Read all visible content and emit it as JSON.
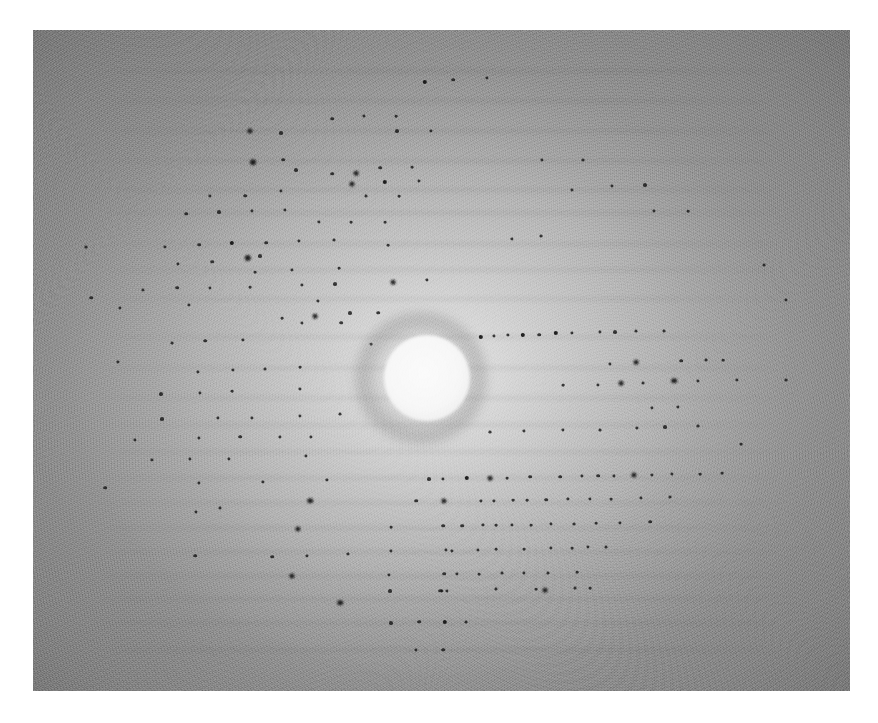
{
  "image": {
    "kind": "photograph",
    "subject": "x-ray-diffraction-pattern",
    "caption": "",
    "border_color": "#ffffff",
    "print": {
      "left": 33,
      "top": 30,
      "width": 817,
      "height": 661,
      "base_color": "#9a9a9a",
      "center_color": "#c9c9c9",
      "corner_color": "#7d7d7d",
      "grain": "heavy film grain / halftone screen"
    },
    "beam_stop": {
      "label": "beam-stop shadow",
      "center_x": 427,
      "center_y": 378,
      "radius": 43,
      "color": "#fafafa",
      "halo_color": "#6f6f6f"
    }
  },
  "chart_data": {
    "type": "scatter",
    "title": "",
    "subtitle": "",
    "xlabel": "",
    "ylabel": "",
    "grid": false,
    "legend": "none",
    "xlim": [
      33,
      850
    ],
    "ylim": [
      30,
      691
    ],
    "spot_color": "#161616",
    "layer_lines_y": [
      71,
      101,
      131,
      161,
      190,
      213,
      244,
      270,
      299,
      337,
      368,
      398,
      425,
      452,
      478,
      503,
      528,
      552,
      576,
      599,
      623,
      650
    ],
    "points": [
      {
        "x": 250,
        "y": 131,
        "r": 2.6
      },
      {
        "x": 281,
        "y": 133,
        "r": 2.0
      },
      {
        "x": 332,
        "y": 119,
        "r": 1.8
      },
      {
        "x": 364,
        "y": 116,
        "r": 1.6
      },
      {
        "x": 396,
        "y": 116,
        "r": 1.4
      },
      {
        "x": 425,
        "y": 82,
        "r": 2.2
      },
      {
        "x": 453,
        "y": 80,
        "r": 1.8
      },
      {
        "x": 487,
        "y": 78,
        "r": 1.6
      },
      {
        "x": 397,
        "y": 131,
        "r": 2.0
      },
      {
        "x": 431,
        "y": 131,
        "r": 1.6
      },
      {
        "x": 253,
        "y": 162,
        "r": 3.0
      },
      {
        "x": 283,
        "y": 160,
        "r": 1.8
      },
      {
        "x": 296,
        "y": 170,
        "r": 2.0
      },
      {
        "x": 380,
        "y": 168,
        "r": 1.8
      },
      {
        "x": 412,
        "y": 167,
        "r": 1.4
      },
      {
        "x": 356,
        "y": 173,
        "r": 2.4
      },
      {
        "x": 332,
        "y": 174,
        "r": 1.8
      },
      {
        "x": 542,
        "y": 160,
        "r": 1.6
      },
      {
        "x": 583,
        "y": 160,
        "r": 1.5
      },
      {
        "x": 210,
        "y": 196,
        "r": 1.6
      },
      {
        "x": 245,
        "y": 196,
        "r": 1.8
      },
      {
        "x": 281,
        "y": 191,
        "r": 1.6
      },
      {
        "x": 352,
        "y": 184,
        "r": 2.6
      },
      {
        "x": 385,
        "y": 182,
        "r": 2.2
      },
      {
        "x": 419,
        "y": 181,
        "r": 1.6
      },
      {
        "x": 366,
        "y": 196,
        "r": 1.5
      },
      {
        "x": 399,
        "y": 196,
        "r": 1.4
      },
      {
        "x": 612,
        "y": 186,
        "r": 1.6
      },
      {
        "x": 645,
        "y": 185,
        "r": 2.0
      },
      {
        "x": 572,
        "y": 190,
        "r": 1.6
      },
      {
        "x": 186,
        "y": 214,
        "r": 1.8
      },
      {
        "x": 219,
        "y": 212,
        "r": 2.0
      },
      {
        "x": 252,
        "y": 211,
        "r": 1.6
      },
      {
        "x": 285,
        "y": 210,
        "r": 1.6
      },
      {
        "x": 319,
        "y": 222,
        "r": 1.6
      },
      {
        "x": 351,
        "y": 222,
        "r": 1.4
      },
      {
        "x": 385,
        "y": 222,
        "r": 1.4
      },
      {
        "x": 654,
        "y": 211,
        "r": 1.6
      },
      {
        "x": 688,
        "y": 211,
        "r": 1.4
      },
      {
        "x": 165,
        "y": 247,
        "r": 1.6
      },
      {
        "x": 199,
        "y": 245,
        "r": 1.8
      },
      {
        "x": 232,
        "y": 243,
        "r": 2.2
      },
      {
        "x": 266,
        "y": 243,
        "r": 1.8
      },
      {
        "x": 299,
        "y": 241,
        "r": 1.6
      },
      {
        "x": 334,
        "y": 240,
        "r": 1.5
      },
      {
        "x": 248,
        "y": 258,
        "r": 3.2
      },
      {
        "x": 212,
        "y": 262,
        "r": 1.8
      },
      {
        "x": 178,
        "y": 264,
        "r": 1.6
      },
      {
        "x": 388,
        "y": 245,
        "r": 1.4
      },
      {
        "x": 512,
        "y": 239,
        "r": 1.6
      },
      {
        "x": 541,
        "y": 236,
        "r": 1.5
      },
      {
        "x": 260,
        "y": 256,
        "r": 2.0
      },
      {
        "x": 292,
        "y": 270,
        "r": 1.6
      },
      {
        "x": 255,
        "y": 272,
        "r": 1.4
      },
      {
        "x": 339,
        "y": 268,
        "r": 1.4
      },
      {
        "x": 143,
        "y": 290,
        "r": 1.6
      },
      {
        "x": 177,
        "y": 288,
        "r": 1.8
      },
      {
        "x": 210,
        "y": 288,
        "r": 1.6
      },
      {
        "x": 250,
        "y": 287,
        "r": 1.4
      },
      {
        "x": 302,
        "y": 285,
        "r": 1.6
      },
      {
        "x": 335,
        "y": 284,
        "r": 2.0
      },
      {
        "x": 393,
        "y": 282,
        "r": 2.4
      },
      {
        "x": 427,
        "y": 280,
        "r": 1.6
      },
      {
        "x": 120,
        "y": 308,
        "r": 1.6
      },
      {
        "x": 189,
        "y": 305,
        "r": 1.6
      },
      {
        "x": 318,
        "y": 301,
        "r": 1.6
      },
      {
        "x": 350,
        "y": 313,
        "r": 2.0
      },
      {
        "x": 315,
        "y": 316,
        "r": 2.4
      },
      {
        "x": 378,
        "y": 313,
        "r": 1.8
      },
      {
        "x": 341,
        "y": 323,
        "r": 1.8
      },
      {
        "x": 302,
        "y": 323,
        "r": 1.6
      },
      {
        "x": 282,
        "y": 318,
        "r": 1.4
      },
      {
        "x": 481,
        "y": 337,
        "r": 2.2
      },
      {
        "x": 494,
        "y": 336,
        "r": 1.6
      },
      {
        "x": 508,
        "y": 335,
        "r": 1.6
      },
      {
        "x": 523,
        "y": 335,
        "r": 2.2
      },
      {
        "x": 539,
        "y": 335,
        "r": 1.8
      },
      {
        "x": 556,
        "y": 333,
        "r": 2.2
      },
      {
        "x": 572,
        "y": 333,
        "r": 1.6
      },
      {
        "x": 600,
        "y": 332,
        "r": 1.6
      },
      {
        "x": 615,
        "y": 332,
        "r": 2.0
      },
      {
        "x": 636,
        "y": 331,
        "r": 1.5
      },
      {
        "x": 664,
        "y": 331,
        "r": 1.5
      },
      {
        "x": 205,
        "y": 341,
        "r": 1.8
      },
      {
        "x": 243,
        "y": 340,
        "r": 1.6
      },
      {
        "x": 172,
        "y": 343,
        "r": 1.5
      },
      {
        "x": 371,
        "y": 344,
        "r": 1.4
      },
      {
        "x": 233,
        "y": 370,
        "r": 1.6
      },
      {
        "x": 265,
        "y": 369,
        "r": 1.5
      },
      {
        "x": 300,
        "y": 367,
        "r": 1.4
      },
      {
        "x": 198,
        "y": 372,
        "r": 1.6
      },
      {
        "x": 610,
        "y": 364,
        "r": 1.6
      },
      {
        "x": 636,
        "y": 362,
        "r": 2.4
      },
      {
        "x": 681,
        "y": 361,
        "r": 1.8
      },
      {
        "x": 706,
        "y": 360,
        "r": 1.5
      },
      {
        "x": 723,
        "y": 360,
        "r": 1.4
      },
      {
        "x": 161,
        "y": 394,
        "r": 2.0
      },
      {
        "x": 200,
        "y": 393,
        "r": 1.6
      },
      {
        "x": 232,
        "y": 391,
        "r": 1.4
      },
      {
        "x": 300,
        "y": 389,
        "r": 1.6
      },
      {
        "x": 563,
        "y": 385,
        "r": 1.4
      },
      {
        "x": 598,
        "y": 385,
        "r": 1.6
      },
      {
        "x": 621,
        "y": 383,
        "r": 2.4
      },
      {
        "x": 643,
        "y": 383,
        "r": 1.5
      },
      {
        "x": 674,
        "y": 381,
        "r": 2.8
      },
      {
        "x": 698,
        "y": 381,
        "r": 1.6
      },
      {
        "x": 737,
        "y": 380,
        "r": 1.6
      },
      {
        "x": 162,
        "y": 419,
        "r": 2.0
      },
      {
        "x": 218,
        "y": 418,
        "r": 1.6
      },
      {
        "x": 252,
        "y": 418,
        "r": 1.6
      },
      {
        "x": 300,
        "y": 416,
        "r": 1.6
      },
      {
        "x": 340,
        "y": 414,
        "r": 1.5
      },
      {
        "x": 652,
        "y": 408,
        "r": 1.6
      },
      {
        "x": 678,
        "y": 407,
        "r": 1.6
      },
      {
        "x": 135,
        "y": 440,
        "r": 1.6
      },
      {
        "x": 199,
        "y": 438,
        "r": 1.6
      },
      {
        "x": 240,
        "y": 437,
        "r": 1.8
      },
      {
        "x": 280,
        "y": 437,
        "r": 1.6
      },
      {
        "x": 311,
        "y": 437,
        "r": 1.6
      },
      {
        "x": 490,
        "y": 432,
        "r": 1.5
      },
      {
        "x": 524,
        "y": 431,
        "r": 1.6
      },
      {
        "x": 563,
        "y": 430,
        "r": 1.6
      },
      {
        "x": 600,
        "y": 430,
        "r": 1.5
      },
      {
        "x": 637,
        "y": 428,
        "r": 1.6
      },
      {
        "x": 665,
        "y": 427,
        "r": 2.0
      },
      {
        "x": 698,
        "y": 426,
        "r": 1.5
      },
      {
        "x": 152,
        "y": 460,
        "r": 1.6
      },
      {
        "x": 190,
        "y": 459,
        "r": 1.6
      },
      {
        "x": 229,
        "y": 459,
        "r": 1.6
      },
      {
        "x": 306,
        "y": 456,
        "r": 1.6
      },
      {
        "x": 199,
        "y": 483,
        "r": 1.6
      },
      {
        "x": 263,
        "y": 482,
        "r": 1.6
      },
      {
        "x": 327,
        "y": 480,
        "r": 1.6
      },
      {
        "x": 429,
        "y": 479,
        "r": 2.0
      },
      {
        "x": 443,
        "y": 479,
        "r": 1.6
      },
      {
        "x": 467,
        "y": 478,
        "r": 2.2
      },
      {
        "x": 490,
        "y": 478,
        "r": 2.4
      },
      {
        "x": 507,
        "y": 478,
        "r": 1.4
      },
      {
        "x": 530,
        "y": 477,
        "r": 1.8
      },
      {
        "x": 560,
        "y": 477,
        "r": 1.8
      },
      {
        "x": 582,
        "y": 476,
        "r": 1.6
      },
      {
        "x": 598,
        "y": 476,
        "r": 1.8
      },
      {
        "x": 614,
        "y": 476,
        "r": 1.6
      },
      {
        "x": 634,
        "y": 475,
        "r": 2.6
      },
      {
        "x": 652,
        "y": 475,
        "r": 1.6
      },
      {
        "x": 672,
        "y": 474,
        "r": 1.6
      },
      {
        "x": 700,
        "y": 474,
        "r": 1.4
      },
      {
        "x": 722,
        "y": 473,
        "r": 1.4
      },
      {
        "x": 310,
        "y": 501,
        "r": 2.8
      },
      {
        "x": 416,
        "y": 501,
        "r": 1.8
      },
      {
        "x": 444,
        "y": 501,
        "r": 2.6
      },
      {
        "x": 481,
        "y": 501,
        "r": 1.6
      },
      {
        "x": 494,
        "y": 501,
        "r": 1.6
      },
      {
        "x": 513,
        "y": 500,
        "r": 1.4
      },
      {
        "x": 527,
        "y": 500,
        "r": 1.4
      },
      {
        "x": 546,
        "y": 500,
        "r": 1.8
      },
      {
        "x": 568,
        "y": 499,
        "r": 1.6
      },
      {
        "x": 590,
        "y": 499,
        "r": 1.6
      },
      {
        "x": 611,
        "y": 499,
        "r": 1.4
      },
      {
        "x": 641,
        "y": 498,
        "r": 1.6
      },
      {
        "x": 670,
        "y": 497,
        "r": 1.5
      },
      {
        "x": 220,
        "y": 508,
        "r": 1.5
      },
      {
        "x": 196,
        "y": 512,
        "r": 1.6
      },
      {
        "x": 391,
        "y": 527,
        "r": 1.4
      },
      {
        "x": 443,
        "y": 526,
        "r": 1.8
      },
      {
        "x": 462,
        "y": 526,
        "r": 1.8
      },
      {
        "x": 483,
        "y": 525,
        "r": 1.6
      },
      {
        "x": 496,
        "y": 525,
        "r": 1.4
      },
      {
        "x": 512,
        "y": 525,
        "r": 1.6
      },
      {
        "x": 531,
        "y": 525,
        "r": 1.4
      },
      {
        "x": 551,
        "y": 524,
        "r": 1.6
      },
      {
        "x": 574,
        "y": 524,
        "r": 1.5
      },
      {
        "x": 596,
        "y": 523,
        "r": 1.4
      },
      {
        "x": 620,
        "y": 523,
        "r": 1.6
      },
      {
        "x": 650,
        "y": 522,
        "r": 1.8
      },
      {
        "x": 298,
        "y": 529,
        "r": 2.6
      },
      {
        "x": 391,
        "y": 551,
        "r": 1.6
      },
      {
        "x": 446,
        "y": 550,
        "r": 1.6
      },
      {
        "x": 452,
        "y": 551,
        "r": 1.6
      },
      {
        "x": 478,
        "y": 550,
        "r": 1.6
      },
      {
        "x": 496,
        "y": 549,
        "r": 1.4
      },
      {
        "x": 524,
        "y": 549,
        "r": 1.4
      },
      {
        "x": 551,
        "y": 548,
        "r": 1.6
      },
      {
        "x": 572,
        "y": 548,
        "r": 1.4
      },
      {
        "x": 588,
        "y": 547,
        "r": 1.6
      },
      {
        "x": 606,
        "y": 547,
        "r": 1.5
      },
      {
        "x": 348,
        "y": 554,
        "r": 1.6
      },
      {
        "x": 307,
        "y": 556,
        "r": 1.6
      },
      {
        "x": 272,
        "y": 557,
        "r": 1.8
      },
      {
        "x": 292,
        "y": 576,
        "r": 2.6
      },
      {
        "x": 389,
        "y": 575,
        "r": 1.6
      },
      {
        "x": 444,
        "y": 574,
        "r": 1.8
      },
      {
        "x": 457,
        "y": 574,
        "r": 1.6
      },
      {
        "x": 479,
        "y": 574,
        "r": 1.4
      },
      {
        "x": 502,
        "y": 573,
        "r": 1.5
      },
      {
        "x": 524,
        "y": 573,
        "r": 1.6
      },
      {
        "x": 548,
        "y": 573,
        "r": 1.5
      },
      {
        "x": 577,
        "y": 572,
        "r": 1.4
      },
      {
        "x": 340,
        "y": 603,
        "r": 2.8
      },
      {
        "x": 390,
        "y": 591,
        "r": 2.0
      },
      {
        "x": 440,
        "y": 591,
        "r": 1.8
      },
      {
        "x": 442,
        "y": 591,
        "r": 1.6
      },
      {
        "x": 447,
        "y": 591,
        "r": 1.6
      },
      {
        "x": 496,
        "y": 589,
        "r": 1.5
      },
      {
        "x": 536,
        "y": 589,
        "r": 1.4
      },
      {
        "x": 575,
        "y": 588,
        "r": 1.5
      },
      {
        "x": 545,
        "y": 590,
        "r": 2.4
      },
      {
        "x": 590,
        "y": 588,
        "r": 1.4
      },
      {
        "x": 391,
        "y": 623,
        "r": 2.0
      },
      {
        "x": 419,
        "y": 622,
        "r": 1.8
      },
      {
        "x": 445,
        "y": 622,
        "r": 2.2
      },
      {
        "x": 466,
        "y": 622,
        "r": 1.5
      },
      {
        "x": 416,
        "y": 650,
        "r": 1.6
      },
      {
        "x": 443,
        "y": 650,
        "r": 1.8
      },
      {
        "x": 91,
        "y": 298,
        "r": 1.8
      },
      {
        "x": 86,
        "y": 247,
        "r": 1.5
      },
      {
        "x": 118,
        "y": 362,
        "r": 1.6
      },
      {
        "x": 105,
        "y": 488,
        "r": 1.8
      },
      {
        "x": 195,
        "y": 556,
        "r": 1.8
      },
      {
        "x": 764,
        "y": 265,
        "r": 1.5
      },
      {
        "x": 786,
        "y": 300,
        "r": 1.6
      },
      {
        "x": 741,
        "y": 444,
        "r": 1.4
      },
      {
        "x": 786,
        "y": 380,
        "r": 1.5
      }
    ]
  }
}
